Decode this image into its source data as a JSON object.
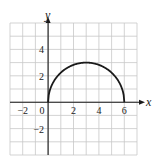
{
  "chart_data": {
    "type": "line",
    "title": "",
    "xlabel": "x",
    "ylabel": "y",
    "xlim": [
      -3,
      7
    ],
    "ylim": [
      -4,
      6
    ],
    "grid": true,
    "grid_step": 1,
    "x_ticks": [
      -2,
      0,
      2,
      4,
      6
    ],
    "y_ticks": [
      4,
      2,
      -2
    ],
    "x_tick_labels": [
      "−2",
      "0",
      "2",
      "4",
      "6"
    ],
    "y_tick_labels": [
      "4",
      "2",
      "−2"
    ],
    "series": [
      {
        "name": "semicircle",
        "description": "Upper half of circle centered at (3,0), radius 3",
        "x": [
          0,
          0.5,
          1,
          1.5,
          2,
          2.5,
          3,
          3.5,
          4,
          4.5,
          5,
          5.5,
          6
        ],
        "y": [
          0,
          1.66,
          2.24,
          2.6,
          2.83,
          2.96,
          3,
          2.96,
          2.83,
          2.6,
          2.24,
          1.66,
          0
        ]
      }
    ],
    "legend": null
  },
  "colors": {
    "grid": "#c8c8c8",
    "axis": "#1a1a1a",
    "curve": "#1a1a1a",
    "background": "#ffffff"
  }
}
